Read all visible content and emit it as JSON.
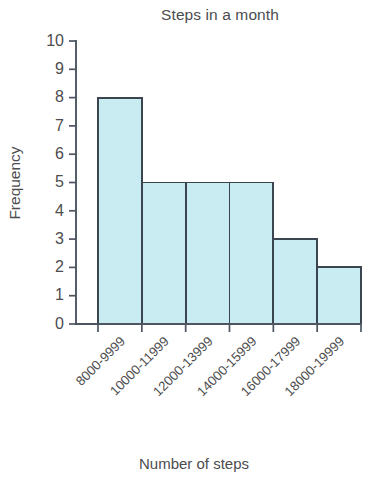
{
  "chart_data": {
    "type": "bar",
    "title": "Steps in a month",
    "xlabel": "Number of steps",
    "ylabel": "Frequency",
    "categories": [
      "8000-9999",
      "10000-11999",
      "12000-13999",
      "14000-15999",
      "16000-17999",
      "18000-19999"
    ],
    "values": [
      8,
      5,
      5,
      5,
      3,
      2
    ],
    "ylim": [
      0,
      10
    ],
    "ytick_labels": [
      "0",
      "1",
      "2",
      "3",
      "4",
      "5",
      "6",
      "7",
      "8",
      "9",
      "10"
    ],
    "ytick_step": 1,
    "grid": false,
    "legend": null,
    "bar_fill_color": "#c9ecf2",
    "bar_stroke_color": "#3a4550",
    "axis_color": "#4c5560",
    "text_color": "#4c4c4e",
    "background_color": "#ffffff",
    "xtick_label_rotation_deg": 45
  }
}
